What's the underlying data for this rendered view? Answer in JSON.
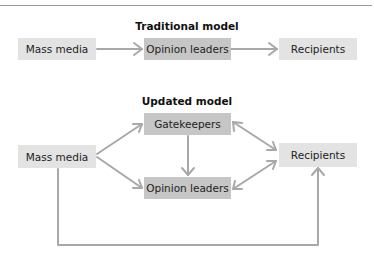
{
  "colors": {
    "light_box": "#e3e3e3",
    "dark_box": "#c6c6c6",
    "arrow": "#a8a8a8",
    "rule": "#9a9a9a"
  },
  "traditional": {
    "title": "Traditional model",
    "nodes": {
      "mass_media": "Mass media",
      "opinion_leaders": "Opinion leaders",
      "recipients": "Recipients"
    },
    "edges": [
      {
        "from": "Mass media",
        "to": "Opinion leaders",
        "type": "one-way"
      },
      {
        "from": "Opinion leaders",
        "to": "Recipients",
        "type": "one-way"
      }
    ]
  },
  "updated": {
    "title": "Updated model",
    "nodes": {
      "mass_media": "Mass media",
      "gatekeepers": "Gatekeepers",
      "opinion_leaders": "Opinion leaders",
      "recipients": "Recipients"
    },
    "edges": [
      {
        "from": "Mass media",
        "to": "Gatekeepers",
        "type": "one-way"
      },
      {
        "from": "Mass media",
        "to": "Opinion leaders",
        "type": "one-way"
      },
      {
        "from": "Gatekeepers",
        "to": "Opinion leaders",
        "type": "one-way"
      },
      {
        "from": "Gatekeepers",
        "to": "Recipients",
        "type": "two-way"
      },
      {
        "from": "Opinion leaders",
        "to": "Recipients",
        "type": "two-way"
      },
      {
        "from": "Mass media",
        "to": "Recipients",
        "type": "one-way",
        "route": "bottom loop"
      }
    ]
  }
}
